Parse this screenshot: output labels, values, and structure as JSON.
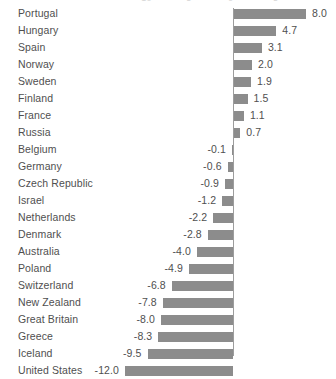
{
  "chart_data": {
    "type": "bar",
    "orientation": "horizontal",
    "title": "",
    "subtitle": "",
    "xlabel": "",
    "ylabel": "",
    "grid": false,
    "legend": "none",
    "zero_line": true,
    "xlim": [
      -12.0,
      8.0
    ],
    "categories": [
      "Portugal",
      "Hungary",
      "Spain",
      "Norway",
      "Sweden",
      "Finland",
      "France",
      "Russia",
      "Belgium",
      "Germany",
      "Czech Republic",
      "Israel",
      "Netherlands",
      "Denmark",
      "Australia",
      "Poland",
      "Switzerland",
      "New Zealand",
      "Great Britain",
      "Greece",
      "Iceland",
      "United States"
    ],
    "values": [
      8.0,
      4.7,
      3.1,
      2.0,
      1.9,
      1.5,
      1.1,
      0.7,
      -0.1,
      -0.6,
      -0.9,
      -1.2,
      -2.2,
      -2.8,
      -4.0,
      -4.9,
      -6.8,
      -7.8,
      -8.0,
      -8.3,
      -9.5,
      -12.0
    ],
    "value_labels": [
      "8.0",
      "4.7",
      "3.1",
      "2.0",
      "1.9",
      "1.5",
      "1.1",
      "0.7",
      "-0.1",
      "-0.6",
      "-0.9",
      "-1.2",
      "-2.2",
      "-2.8",
      "-4.0",
      "-4.9",
      "-6.8",
      "-7.8",
      "-8.0",
      "-8.3",
      "-9.5",
      "-12.0"
    ],
    "bar_color": "#8c8c8c",
    "text_color": "#4f4f4f",
    "axis_color": "#9d9d9d",
    "background": "#ffffff",
    "top_cutoff_ticks": [
      "-10",
      "-5",
      "0",
      "5"
    ]
  }
}
